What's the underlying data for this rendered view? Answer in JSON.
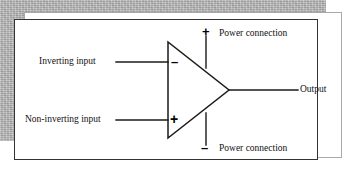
{
  "figure": {
    "type": "operational-amplifier-schematic",
    "labels": {
      "inverting_input": "Inverting input",
      "non_inverting_input": "Non-inverting input",
      "power_connection_positive": "Power connection",
      "power_connection_negative": "Power connection",
      "output": "Output"
    },
    "signs": {
      "inverting": "–",
      "non_inverting": "+",
      "supply_positive": "+",
      "supply_negative": "–"
    },
    "colors": {
      "line": "#1a1a1a",
      "frame_border": "#333333",
      "panel_background": "#ffffff",
      "backdrop_grey": "#b2b2b2",
      "text": "#111111"
    },
    "geometry": {
      "triangle": {
        "top_left": [
          168,
          42
        ],
        "bottom_left": [
          168,
          138
        ],
        "right_vertex": [
          229,
          90
        ]
      },
      "inverting_input_line_y": 62,
      "non_inverting_input_line_y": 120,
      "supply_line_x": 206,
      "output_line_y": 90
    }
  }
}
